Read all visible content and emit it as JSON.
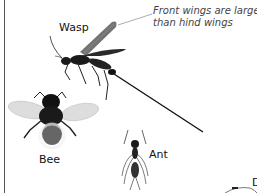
{
  "figure": {
    "callout": {
      "line1": "Front wings are larger",
      "line2": "than hind wings",
      "target": "wasp-front-wing"
    },
    "insects": [
      {
        "name": "Wasp",
        "label": "Wasp"
      },
      {
        "name": "Bee",
        "label": "Bee"
      },
      {
        "name": "Ant",
        "label": "Ant"
      }
    ],
    "clipped_label_fragment": "D",
    "colors": {
      "background": "#ffffff",
      "insect_body": "#1a1a1a",
      "wing": "#c8c8c8",
      "callout_text": "#444444",
      "border_line": "#555555"
    }
  }
}
